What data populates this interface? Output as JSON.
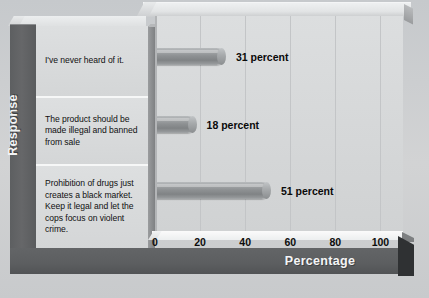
{
  "chart_data": {
    "type": "bar",
    "orientation": "horizontal",
    "title": "",
    "xlabel": "Percentage",
    "ylabel": "Response",
    "xlim": [
      0,
      110
    ],
    "xticks": [
      0,
      20,
      40,
      60,
      80,
      100
    ],
    "grid": true,
    "legend": null,
    "categories": [
      "I've never heard of it.",
      "The product should be made illegal and banned from sale",
      "Prohibition of drugs just creates a black market. Keep it legal and let the cops focus on violent crime."
    ],
    "values": [
      31,
      18,
      51
    ],
    "data_labels": [
      "31 percent",
      "18 percent",
      "51 percent"
    ],
    "units": "percent"
  },
  "axes": {
    "y_title": "Response",
    "x_title": "Percentage",
    "tick_labels": [
      "0",
      "20",
      "40",
      "60",
      "80",
      "100"
    ]
  },
  "colors": {
    "page_background": "#cdcfd1",
    "frame": "#5d5f61",
    "frame_text": "#f2f3f4",
    "label_panel": "#d9dbdc",
    "plot_background": "#d6d8d9",
    "gridline": "#c3c5c7",
    "bar": "#8e9193",
    "bar_highlight": "#b8bbbd",
    "value_text": "#0a0a0a",
    "shadow": "#2f3133"
  }
}
